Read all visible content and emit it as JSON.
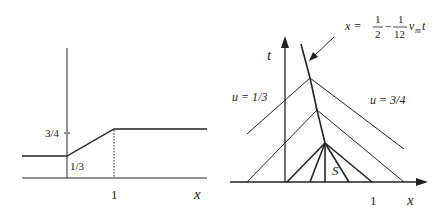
{
  "left_plot": {
    "x_axis_label": "x",
    "tick_x": "1",
    "level_high": "3/4",
    "level_low": "1/3"
  },
  "right_plot": {
    "t_axis_label": "t",
    "x_axis_label": "x",
    "tick_x": "1",
    "region_left": "u = 1/3",
    "region_right": "u = 3/4",
    "region_center": "S",
    "shock_formula": {
      "lhs": "x =",
      "frac1_num": "1",
      "frac1_den": "2",
      "minus": "−",
      "frac2_num": "1",
      "frac2_den": "12",
      "tail": "v",
      "sub": "m",
      "var": "t"
    }
  },
  "colors": {
    "stroke": "#222222",
    "background": "#ffffff"
  }
}
